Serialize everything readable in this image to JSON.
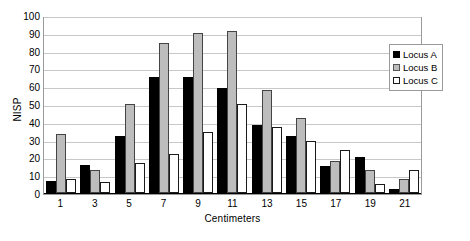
{
  "chart_data": {
    "type": "bar",
    "title": "",
    "xlabel": "Centimeters",
    "ylabel": "NISP",
    "categories": [
      "1",
      "3",
      "5",
      "7",
      "9",
      "11",
      "13",
      "15",
      "17",
      "19",
      "21"
    ],
    "series": [
      {
        "name": "Locus A",
        "color": "#000000",
        "values": [
          7,
          16,
          32,
          65,
          65,
          59,
          38,
          32,
          15,
          20,
          2
        ]
      },
      {
        "name": "Locus B",
        "color": "#bdbdbd",
        "values": [
          33,
          13,
          50,
          84,
          90,
          91,
          58,
          42,
          18,
          13,
          8
        ]
      },
      {
        "name": "Locus C",
        "color": "#ffffff",
        "values": [
          8,
          6,
          17,
          22,
          34,
          50,
          37,
          29,
          24,
          5,
          13
        ]
      }
    ],
    "ylim": [
      0,
      100
    ],
    "yticks": [
      0,
      10,
      20,
      30,
      40,
      50,
      60,
      70,
      80,
      90,
      100
    ],
    "ytick_labels": [
      "0",
      "10",
      "20",
      "30",
      "40",
      "50",
      "60",
      "70",
      "80",
      "90",
      "100"
    ],
    "grid": true,
    "grid_axis": "y",
    "legend_position": "top-right",
    "legend_entries": [
      "Locus A",
      "Locus B",
      "Locus C"
    ],
    "plot_border_color": "#9a9a9a",
    "gridline_color": "#c8c8c8",
    "background_color": "#ffffff"
  }
}
